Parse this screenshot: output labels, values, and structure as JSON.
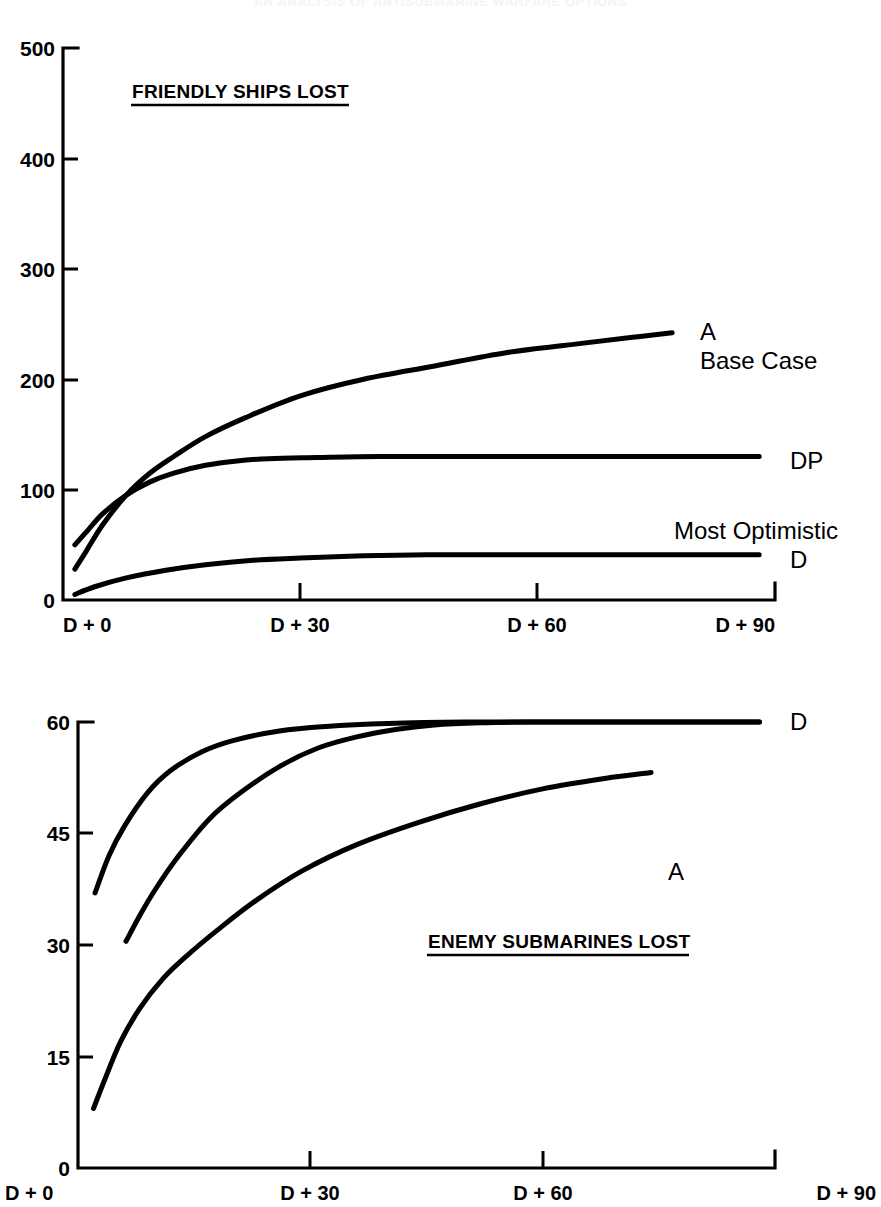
{
  "page": {
    "faint_header": "AN ANALYSIS OF ANTISUBMARINE WARFARE OPTIONS",
    "background_color": "#ffffff",
    "ink_color": "#000000"
  },
  "chart_data": [
    {
      "type": "line",
      "panel": "top",
      "title": "FRIENDLY SHIPS LOST",
      "xlabel": "",
      "ylabel": "",
      "xlim": [
        0,
        90
      ],
      "ylim": [
        0,
        500
      ],
      "grid": false,
      "legend_position": "right-of-curve-ends",
      "x_tick_labels": [
        "D + 0",
        "D + 30",
        "D + 60",
        "D + 90"
      ],
      "x_ticks": [
        0,
        30,
        60,
        90
      ],
      "y_ticks": [
        0,
        100,
        200,
        300,
        400,
        500
      ],
      "y_tick_labels": [
        "0",
        "100",
        "200",
        "300",
        "400",
        "500"
      ],
      "series": [
        {
          "name": "A",
          "label": "A",
          "sublabel": "Base Case",
          "x": [
            1.5,
            3,
            5,
            8,
            11,
            14,
            18,
            23,
            30,
            38,
            47,
            56,
            65,
            72,
            77
          ],
          "values": [
            28,
            45,
            68,
            95,
            115,
            130,
            148,
            165,
            185,
            200,
            212,
            224,
            232,
            238,
            242
          ]
        },
        {
          "name": "DP",
          "label": "DP",
          "sublabel": "",
          "x": [
            1.5,
            3,
            5,
            8,
            11,
            14,
            18,
            22,
            26,
            32,
            40,
            50,
            60,
            70,
            80,
            88
          ],
          "values": [
            50,
            62,
            78,
            95,
            107,
            115,
            122,
            126,
            128,
            129,
            130,
            130,
            130,
            130,
            130,
            130
          ]
        },
        {
          "name": "D",
          "label": "D",
          "sublabel": "Most Optimistic",
          "x": [
            1.5,
            4,
            8,
            13,
            18,
            24,
            30,
            38,
            46,
            56,
            66,
            76,
            84,
            88
          ],
          "values": [
            5,
            12,
            20,
            27,
            32,
            36,
            38,
            40,
            41,
            41,
            41,
            41,
            41,
            41
          ]
        }
      ]
    },
    {
      "type": "line",
      "panel": "bottom",
      "title": "ENEMY SUBMARINES LOST",
      "xlabel": "",
      "ylabel": "",
      "xlim": [
        0,
        90
      ],
      "ylim": [
        0,
        60
      ],
      "grid": false,
      "legend_position": "right-of-curve-ends",
      "x_tick_labels": [
        "D + 0",
        "D + 30",
        "D + 60",
        "D + 90"
      ],
      "x_ticks": [
        0,
        30,
        60,
        90
      ],
      "y_ticks": [
        0,
        15,
        30,
        45,
        60
      ],
      "y_tick_labels": [
        "0",
        "15",
        "30",
        "45",
        "60"
      ],
      "series": [
        {
          "name": "D-upper",
          "label": "D",
          "sublabel": "",
          "x": [
            2.2,
            4,
            6,
            9,
            12,
            16,
            20,
            26,
            32,
            40,
            50,
            60,
            70,
            80,
            88
          ],
          "values": [
            37.0,
            42.0,
            46.0,
            50.5,
            53.5,
            56.0,
            57.5,
            58.8,
            59.4,
            59.8,
            60.0,
            60.0,
            60.0,
            60.0,
            60.0
          ]
        },
        {
          "name": "middle",
          "label": "",
          "sublabel": "",
          "x": [
            6.2,
            8,
            10,
            13,
            17,
            21,
            26,
            31,
            36,
            41,
            46,
            52,
            58,
            65,
            72,
            80,
            88
          ],
          "values": [
            30.5,
            34.0,
            37.5,
            42.0,
            47.0,
            50.5,
            54.0,
            56.5,
            58.0,
            59.0,
            59.6,
            59.9,
            60.0,
            60.0,
            60.0,
            60.0,
            60.0
          ]
        },
        {
          "name": "A",
          "label": "A",
          "sublabel": "",
          "x": [
            2.0,
            3.5,
            5.5,
            8,
            11,
            14,
            18,
            23,
            29,
            36,
            44,
            52,
            60,
            68,
            74
          ],
          "values": [
            8.0,
            12.0,
            17.0,
            21.5,
            25.5,
            28.5,
            32.0,
            36.0,
            40.0,
            43.5,
            46.5,
            49.0,
            51.0,
            52.4,
            53.2
          ]
        }
      ]
    }
  ]
}
